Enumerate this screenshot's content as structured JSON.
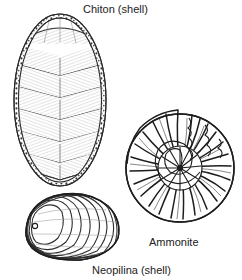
{
  "figure": {
    "background_color": "#ffffff",
    "ink_color": "#1a1a1a",
    "label_color": "#222222",
    "style": "line-engraving"
  },
  "specimens": [
    {
      "id": "chiton",
      "label": "Chiton (shell)",
      "icon": "chiton-shell-icon",
      "shape": "oval",
      "plate_count": 8,
      "has_girdle": true,
      "girdle_texture": "granular",
      "position": "top-left"
    },
    {
      "id": "ammonite",
      "label": "Ammonite",
      "icon": "ammonite-shell-icon",
      "shape": "planispiral",
      "rib_count": 46,
      "whorl_count": 4,
      "has_suture_lines": true,
      "position": "right"
    },
    {
      "id": "neopilina",
      "label": "Neopilina (shell)",
      "icon": "neopilina-shell-icon",
      "shape": "cap-limpet",
      "growth_line_count": 9,
      "apex_position": "upper-left",
      "position": "bottom-left"
    }
  ]
}
